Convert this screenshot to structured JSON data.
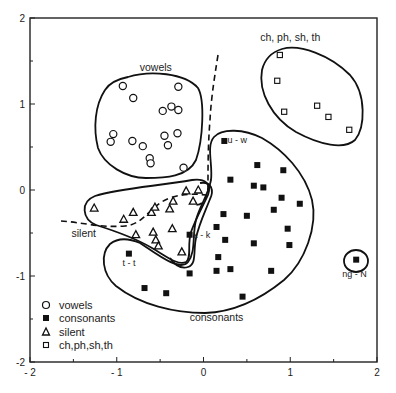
{
  "chart_data": {
    "type": "scatter",
    "title": "",
    "xlabel": "",
    "ylabel": "",
    "xlim": [
      -2,
      2
    ],
    "ylim": [
      -2,
      2
    ],
    "grid": false,
    "x_ticks": [
      -2,
      -1,
      0,
      1,
      2
    ],
    "y_ticks": [
      -2,
      -1,
      0,
      1,
      2
    ],
    "x_tick_labels": [
      "- 2",
      "- 1",
      "0",
      "1",
      "2"
    ],
    "y_tick_labels": [
      "-2",
      "-1",
      "0",
      "1",
      "2"
    ],
    "legend_position": "lower-left inside",
    "series": [
      {
        "name": "vowels",
        "marker": "open-circle",
        "points": [
          [
            -0.93,
            1.21
          ],
          [
            -0.29,
            1.2
          ],
          [
            -0.81,
            1.07
          ],
          [
            -0.47,
            0.92
          ],
          [
            -0.37,
            0.97
          ],
          [
            -0.29,
            0.93
          ],
          [
            -1.04,
            0.65
          ],
          [
            -1.07,
            0.56
          ],
          [
            -0.82,
            0.57
          ],
          [
            -0.7,
            0.51
          ],
          [
            -0.45,
            0.63
          ],
          [
            -0.41,
            0.52
          ],
          [
            -0.3,
            0.66
          ],
          [
            -0.62,
            0.37
          ],
          [
            -0.61,
            0.31
          ],
          [
            -0.23,
            0.26
          ]
        ]
      },
      {
        "name": "consonants",
        "marker": "filled-square",
        "points": [
          [
            0.24,
            0.57
          ],
          [
            0.62,
            0.29
          ],
          [
            0.92,
            0.23
          ],
          [
            0.31,
            0.12
          ],
          [
            0.58,
            0.05
          ],
          [
            0.69,
            0.03
          ],
          [
            0.9,
            -0.09
          ],
          [
            1.11,
            -0.16
          ],
          [
            0.81,
            -0.23
          ],
          [
            0.23,
            -0.28
          ],
          [
            0.5,
            -0.3
          ],
          [
            0.15,
            -0.43
          ],
          [
            0.97,
            -0.45
          ],
          [
            -0.16,
            -0.52
          ],
          [
            0.25,
            -0.58
          ],
          [
            0.58,
            -0.62
          ],
          [
            0.99,
            -0.64
          ],
          [
            0.17,
            -0.78
          ],
          [
            0.15,
            -0.94
          ],
          [
            0.31,
            -0.92
          ],
          [
            -0.16,
            -0.97
          ],
          [
            0.78,
            -0.94
          ],
          [
            0.45,
            -1.24
          ],
          [
            -0.86,
            -0.74
          ],
          [
            -0.68,
            -1.14
          ],
          [
            -0.43,
            -1.2
          ],
          [
            1.76,
            -0.81
          ]
        ]
      },
      {
        "name": "silent",
        "marker": "open-triangle",
        "points": [
          [
            -1.26,
            -0.21
          ],
          [
            -0.92,
            -0.34
          ],
          [
            -0.81,
            -0.26
          ],
          [
            -0.6,
            -0.26
          ],
          [
            -0.56,
            -0.2
          ],
          [
            -0.39,
            -0.22
          ],
          [
            -0.35,
            -0.13
          ],
          [
            -0.2,
            -0.01
          ],
          [
            -0.06,
            0.0
          ],
          [
            -0.12,
            -0.13
          ],
          [
            -0.78,
            -0.52
          ],
          [
            -0.58,
            -0.49
          ],
          [
            -0.55,
            -0.58
          ],
          [
            -0.52,
            -0.65
          ],
          [
            -0.36,
            -0.45
          ],
          [
            -0.25,
            -0.72
          ]
        ]
      },
      {
        "name": "ch,ph,sh,th",
        "marker": "open-square",
        "points": [
          [
            0.88,
            1.57
          ],
          [
            0.85,
            1.27
          ],
          [
            0.93,
            0.91
          ],
          [
            1.31,
            0.98
          ],
          [
            1.44,
            0.85
          ],
          [
            1.68,
            0.7
          ]
        ]
      }
    ],
    "annotations": [
      {
        "text": "vowels",
        "x": -0.55,
        "y": 1.38
      },
      {
        "text": "ch, ph, sh, th",
        "x": 1.0,
        "y": 1.73
      },
      {
        "text": "silent",
        "x": -1.38,
        "y": -0.55
      },
      {
        "text": "consonants",
        "x": 0.15,
        "y": -1.52
      },
      {
        "text": "u - w",
        "x": 0.39,
        "y": 0.55
      },
      {
        "text": "k - k",
        "x": -0.02,
        "y": -0.56
      },
      {
        "text": "t - t",
        "x": -0.86,
        "y": -0.88
      },
      {
        "text": "ng - N",
        "x": 1.74,
        "y": -1.01
      }
    ]
  },
  "legend": {
    "items": [
      {
        "label": "vowels",
        "marker": "open-circle"
      },
      {
        "label": "consonants",
        "marker": "filled-square"
      },
      {
        "label": "silent",
        "marker": "open-triangle"
      },
      {
        "label": "ch,ph,sh,th",
        "marker": "open-square"
      }
    ]
  },
  "colors": {
    "ink": "#111111",
    "background": "#ffffff"
  }
}
